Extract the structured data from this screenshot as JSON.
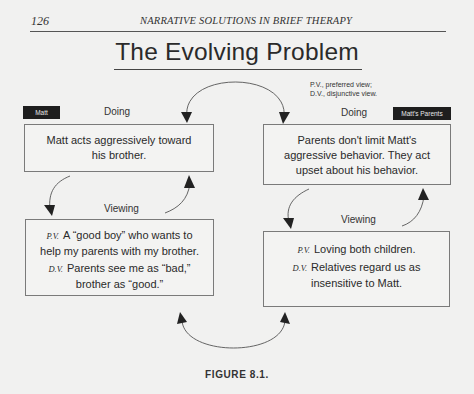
{
  "page": {
    "number": "126",
    "running_head": "NARRATIVE SOLUTIONS IN BRIEF THERAPY"
  },
  "figure": {
    "title": "The Evolving Problem",
    "caption": "FIGURE 8.1.",
    "legend": {
      "line1": "P.V., preferred view;",
      "line2": "D.V., disjunctive view."
    },
    "left": {
      "tag": "Matt",
      "doing_label": "Doing",
      "doing_text": [
        "Matt acts aggressively toward",
        "his brother."
      ],
      "viewing_label": "Viewing",
      "pv_abbr": "P.V.",
      "pv_text_1": "A “good boy” who wants to",
      "pv_text_2": "help my parents with my brother.",
      "dv_abbr": "D.V.",
      "dv_text_1": "Parents see me as “bad,”",
      "dv_text_2": "brother as “good.”"
    },
    "right": {
      "tag": "Matt's Parents",
      "doing_label": "Doing",
      "doing_text": [
        "Parents don't limit Matt's",
        "aggressive behavior. They act",
        "upset about his behavior."
      ],
      "viewing_label": "Viewing",
      "pv_abbr": "P.V.",
      "pv_text_1": "Loving both children.",
      "dv_abbr": "D.V.",
      "dv_text_1": "Relatives regard us as",
      "dv_text_2": "insensitive to Matt."
    },
    "colors": {
      "background": "#f1f1f0",
      "tag_bg": "#1e1e1e",
      "box_border": "#7a7a7a",
      "text": "#2a2a2a"
    }
  }
}
